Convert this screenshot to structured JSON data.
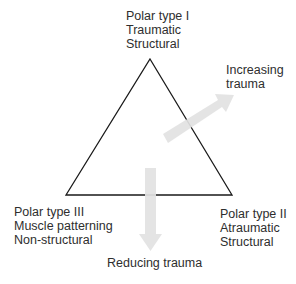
{
  "diagram": {
    "type": "triangle",
    "vertices": {
      "top": {
        "lines": [
          "Polar type I",
          "Traumatic",
          "Structural"
        ]
      },
      "bottom_right": {
        "lines": [
          "Polar type II",
          "Atraumatic",
          "Structural"
        ]
      },
      "bottom_left": {
        "lines": [
          "Polar type III",
          "Muscle patterning",
          "Non-structural"
        ]
      }
    },
    "arrows": {
      "increasing": {
        "direction": "up-right",
        "lines": [
          "Increasing",
          "trauma"
        ]
      },
      "reducing": {
        "direction": "down",
        "label": "Reducing trauma"
      }
    },
    "colors": {
      "triangle_stroke": "#1a1a1a",
      "arrow_fill": "#e2e2e2",
      "text": "#2e2e2e",
      "background": "#ffffff"
    }
  }
}
